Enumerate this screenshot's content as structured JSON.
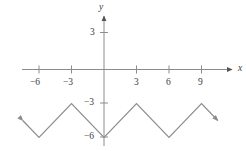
{
  "figure": {
    "background": "#ffffff",
    "line_color": "#8c8c8c",
    "axis_color": "#8c8c8c",
    "text_color": "#3c3c3c",
    "x_axis_name": "x",
    "y_axis_name": "y"
  },
  "chart_data": {
    "type": "line",
    "title": "",
    "xlabel": "x",
    "ylabel": "y",
    "xlim": [
      -7.8,
      11.6
    ],
    "ylim": [
      -7.0,
      4.2
    ],
    "grid": false,
    "legend": null,
    "xticks": [
      -6,
      -3,
      3,
      6,
      9
    ],
    "xtick_labels": [
      "−6",
      "−3",
      "3",
      "6",
      "9"
    ],
    "yticks": [
      3,
      -3,
      -6
    ],
    "ytick_labels": [
      "3",
      "−3",
      "−6"
    ],
    "series": [
      {
        "name": "triangular wave",
        "description": "V-shaped zigzag, period 6, minima y=-6 at x=0,±6,±12, maxima y=-3 at x=±3,±9",
        "arrow_start": true,
        "arrow_end": true,
        "points": [
          {
            "x": -7.5,
            "y": -4.5
          },
          {
            "x": -6,
            "y": -6
          },
          {
            "x": -3,
            "y": -3
          },
          {
            "x": 0,
            "y": -6
          },
          {
            "x": 3,
            "y": -3
          },
          {
            "x": 6,
            "y": -6
          },
          {
            "x": 9,
            "y": -3
          },
          {
            "x": 10.5,
            "y": -4.5
          }
        ]
      }
    ]
  }
}
